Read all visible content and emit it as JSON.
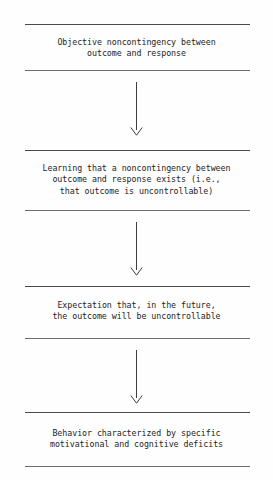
{
  "document": {
    "type": "flowchart",
    "orientation": "vertical-top-to-bottom",
    "title": "Learned helplessness model flowchart",
    "background_color": "#fefefe",
    "text_color": "#1d1d1d",
    "rule_color": "#4a4a4a",
    "arrow_color": "#3d3d3d"
  },
  "stages": [
    {
      "index": 1,
      "name": "objective-noncontingency",
      "text": "Objective noncontingency between\noutcome and response",
      "lines": [
        "Objective noncontingency between",
        "outcome and response"
      ]
    },
    {
      "index": 2,
      "name": "learning-noncontingency",
      "text": "Learning that a noncontingency between\noutcome and response exists (i.e.,\nthat outcome is uncontrollable)",
      "lines": [
        "Learning that a noncontingency between",
        "outcome and response exists (i.e.,",
        "that outcome is uncontrollable)"
      ]
    },
    {
      "index": 3,
      "name": "expectation-future",
      "text": "Expectation that, in the future,\nthe outcome will be uncontrollable",
      "lines": [
        "Expectation that, in the future,",
        "the outcome will be uncontrollable"
      ]
    },
    {
      "index": 4,
      "name": "behavior-deficits",
      "text": "Behavior characterized by specific\nmotivational and cognitive deficits",
      "lines": [
        "Behavior characterized by specific",
        "motivational and cognitive deficits"
      ]
    }
  ],
  "connectors": [
    {
      "index": 1,
      "name": "arrow-stage1-to-stage2",
      "from": "objective-noncontingency",
      "to": "learning-noncontingency",
      "glyph": "down-arrow"
    },
    {
      "index": 2,
      "name": "arrow-stage2-to-stage3",
      "from": "learning-noncontingency",
      "to": "expectation-future",
      "glyph": "down-arrow"
    },
    {
      "index": 3,
      "name": "arrow-stage3-to-stage4",
      "from": "expectation-future",
      "to": "behavior-deficits",
      "glyph": "down-arrow"
    }
  ]
}
